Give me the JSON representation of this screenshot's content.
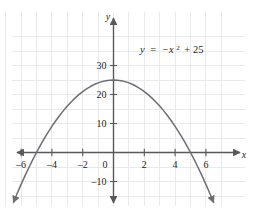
{
  "figure": {
    "name": "parabola-graph",
    "width": 257,
    "height": 216,
    "background_color": "#ffffff"
  },
  "annotation": {
    "equation_plain": "y = -x² + 25",
    "lhs": "y",
    "equals": "=",
    "neg_x": "−x",
    "exponent": "2",
    "plus_const": "+ 25"
  },
  "axes": {
    "x_axis_label": "x",
    "y_axis_label": "y",
    "axis_color": "#58595b",
    "grid_color": "#e8e8ea",
    "x_tick_labels": [
      "–6",
      "–4",
      "–2",
      "0",
      "2",
      "4",
      "6"
    ],
    "x_tick_values": [
      -6,
      -4,
      -2,
      0,
      2,
      4,
      6
    ],
    "y_tick_labels": [
      "30",
      "20",
      "10",
      "–10"
    ],
    "y_tick_values": [
      30,
      20,
      10,
      -10
    ]
  },
  "chart_data": {
    "type": "line",
    "title": "",
    "subtitle": "",
    "xlabel": "x",
    "ylabel": "y",
    "equation": "y = -x^2 + 25",
    "annotations": [
      "y = −x² + 25"
    ],
    "grid": true,
    "legend_position": "none",
    "xlim": [
      -7.3,
      7.3
    ],
    "ylim": [
      -17,
      36
    ],
    "x_ticks": [
      -6,
      -4,
      -2,
      0,
      2,
      4,
      6
    ],
    "y_ticks": [
      30,
      20,
      10,
      -10
    ],
    "x_gridlines": [
      -7,
      -6,
      -5,
      -4,
      -3,
      -2,
      -1,
      0,
      1,
      2,
      3,
      4,
      5,
      6,
      7
    ],
    "y_gridlines": [
      35,
      30,
      25,
      20,
      15,
      10,
      5,
      0,
      -5,
      -10,
      -15
    ],
    "vertex": [
      0,
      25
    ],
    "x_intercepts": [
      -5,
      5
    ],
    "y_intercept": 25,
    "curve_color": "#6d6e71",
    "series": [
      {
        "name": "y = -x^2 + 25",
        "x": [
          -7.0,
          -6.75,
          -6.5,
          -6.25,
          -6.0,
          -5.75,
          -5.5,
          -5.25,
          -5.0,
          -4.75,
          -4.5,
          -4.25,
          -4.0,
          -3.75,
          -3.5,
          -3.25,
          -3.0,
          -2.75,
          -2.5,
          -2.25,
          -2.0,
          -1.75,
          -1.5,
          -1.25,
          -1.0,
          -0.75,
          -0.5,
          -0.25,
          0,
          0.25,
          0.5,
          0.75,
          1.0,
          1.25,
          1.5,
          1.75,
          2.0,
          2.25,
          2.5,
          2.75,
          3.0,
          3.25,
          3.5,
          3.75,
          4.0,
          4.25,
          4.5,
          4.75,
          5.0,
          5.25,
          5.5,
          5.75,
          6.0,
          6.25,
          6.5,
          6.75,
          7.0
        ],
        "y": [
          -24.0,
          -20.5625,
          -17.25,
          -14.0625,
          -11.0,
          -8.0625,
          -5.25,
          -2.5625,
          0,
          2.4375,
          4.75,
          6.9375,
          9.0,
          10.9375,
          12.75,
          14.4375,
          16.0,
          17.4375,
          18.75,
          19.9375,
          21.0,
          21.9375,
          22.75,
          23.4375,
          24.0,
          24.4375,
          24.75,
          24.9375,
          25.0,
          24.9375,
          24.75,
          24.4375,
          24.0,
          23.4375,
          22.75,
          21.9375,
          21.0,
          19.9375,
          18.75,
          17.4375,
          16.0,
          14.4375,
          12.75,
          10.9375,
          9.0,
          6.9375,
          4.75,
          2.4375,
          0,
          -2.5625,
          -5.25,
          -8.0625,
          -11.0,
          -14.0625,
          -17.25,
          -20.5625,
          -24.0
        ]
      }
    ]
  }
}
